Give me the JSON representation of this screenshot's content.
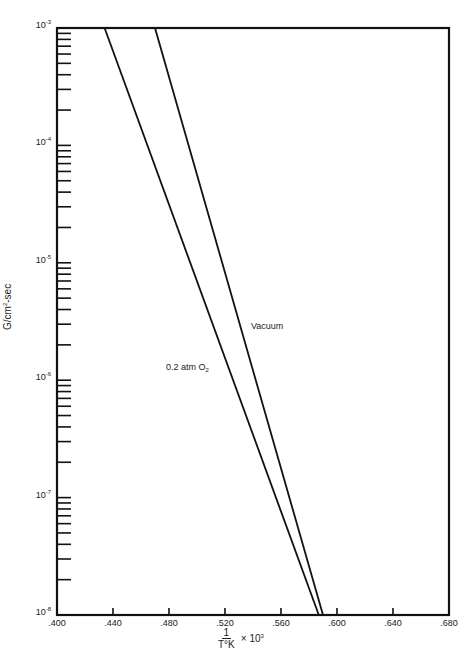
{
  "chart_data": {
    "type": "line",
    "title": "",
    "xlabel": "1/T°K × 10^3",
    "xlabel_parts": {
      "numerator": "1",
      "denominator": "T°K",
      "multiplier": "× 10",
      "exponent": "3"
    },
    "ylabel": "G/cm²-sec",
    "ylabel_parts": {
      "base": "G/cm",
      "exponent": "2",
      "suffix": "-sec"
    },
    "yscale": "log",
    "xlim": [
      0.4,
      0.68
    ],
    "ylim": [
      1e-08,
      0.001
    ],
    "grid": false,
    "legend": "inline labels",
    "x_ticks": [
      ".400",
      ".440",
      ".480",
      ".520",
      ".560",
      ".600",
      ".640",
      ".680"
    ],
    "y_ticks": [
      {
        "base": "10",
        "exp": "-3",
        "value": 0.001
      },
      {
        "base": "10",
        "exp": "-4",
        "value": 0.0001
      },
      {
        "base": "10",
        "exp": "-5",
        "value": 1e-05
      },
      {
        "base": "10",
        "exp": "-6",
        "value": 1e-06
      },
      {
        "base": "10",
        "exp": "-7",
        "value": 1e-07
      },
      {
        "base": "10",
        "exp": "-8",
        "value": 1e-08
      }
    ],
    "series": [
      {
        "name": "0.2 atm O2",
        "label_text": "0.2 atm O",
        "label_sub": "2",
        "points": [
          {
            "x": 0.434,
            "y": 0.001
          },
          {
            "x": 0.587,
            "y": 1e-08
          }
        ]
      },
      {
        "name": "Vacuum",
        "label_text": "Vacuum",
        "points": [
          {
            "x": 0.47,
            "y": 0.001
          },
          {
            "x": 0.59,
            "y": 1e-08
          }
        ]
      }
    ]
  }
}
